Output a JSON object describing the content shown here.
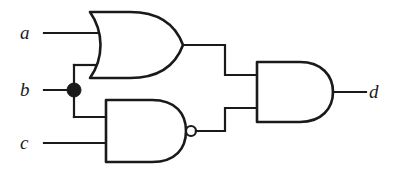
{
  "diagram": {
    "type": "digital-logic-schematic",
    "background_color": "#ffffff",
    "line_color": "#1a1a1a",
    "inputs": [
      {
        "id": "a",
        "label": "a",
        "x": 26,
        "y": 33
      },
      {
        "id": "b",
        "label": "b",
        "x": 26,
        "y": 90
      },
      {
        "id": "c",
        "label": "c",
        "x": 26,
        "y": 143
      }
    ],
    "outputs": [
      {
        "id": "d",
        "label": "d",
        "x": 374,
        "y": 92
      }
    ],
    "gates": [
      {
        "id": "or1",
        "type": "OR",
        "label": "OR",
        "inputs": [
          "a",
          "b"
        ],
        "output": "or1_out"
      },
      {
        "id": "nand1",
        "type": "NAND",
        "label": "NAND",
        "inputs": [
          "b",
          "c"
        ],
        "output": "nand1_out",
        "inverting_bubble": true
      },
      {
        "id": "and1",
        "type": "AND",
        "label": "AND",
        "inputs": [
          "or1_out",
          "nand1_out"
        ],
        "output": "d"
      }
    ],
    "junctions": [
      {
        "id": "b-fanout",
        "net": "b",
        "x": 74,
        "y": 90
      }
    ],
    "expression": "d = (a + b) · !(b · c)"
  }
}
